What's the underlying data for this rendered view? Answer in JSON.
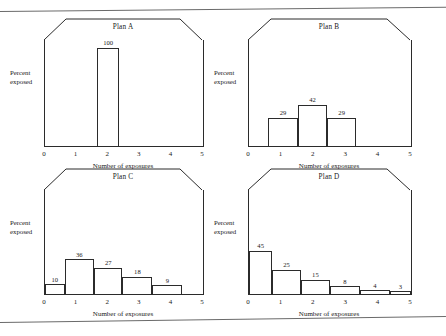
{
  "page": {
    "background": "#ffffff",
    "ink": "#2b2b2b",
    "edge_color": "#6a6a6a"
  },
  "common": {
    "ylabel": "Percent\nexposed",
    "xlabel": "Number of exposures",
    "xticks": [
      "0",
      "1",
      "2",
      "3",
      "4",
      "5"
    ]
  },
  "chart_data": [
    {
      "type": "bar",
      "title": "Plan A",
      "xlabel": "Number of exposures",
      "ylabel": "Percent exposed",
      "categories": [
        "0",
        "1",
        "2",
        "3",
        "4",
        "5"
      ],
      "tick_values": [
        0,
        1,
        2,
        3,
        4,
        5
      ],
      "bars": [
        {
          "x": 2,
          "value": 100,
          "label": "100",
          "left": 1.65,
          "right": 2.35
        }
      ],
      "xlim": [
        0,
        5
      ],
      "ylim": [
        0,
        108
      ],
      "grid": false,
      "legend": false
    },
    {
      "type": "bar",
      "title": "Plan B",
      "xlabel": "Number of exposures",
      "ylabel": "Percent exposed",
      "categories": [
        "0",
        "1",
        "2",
        "3",
        "4",
        "5"
      ],
      "tick_values": [
        0,
        1,
        2,
        3,
        4,
        5
      ],
      "bars": [
        {
          "x": 1,
          "value": 29,
          "label": "29",
          "left": 0.6,
          "right": 1.5
        },
        {
          "x": 2,
          "value": 42,
          "label": "42",
          "left": 1.5,
          "right": 2.42
        },
        {
          "x": 3,
          "value": 29,
          "label": "29",
          "left": 2.42,
          "right": 3.3
        }
      ],
      "xlim": [
        0,
        5
      ],
      "ylim": [
        0,
        108
      ],
      "grid": false,
      "legend": false
    },
    {
      "type": "bar",
      "title": "Plan C",
      "xlabel": "Number of exposures",
      "ylabel": "Percent exposed",
      "categories": [
        "0",
        "1",
        "2",
        "3",
        "4",
        "5"
      ],
      "tick_values": [
        0,
        1,
        2,
        3,
        4,
        5
      ],
      "bars": [
        {
          "x": 0,
          "value": 10,
          "label": "10",
          "left": 0.0,
          "right": 0.62
        },
        {
          "x": 1,
          "value": 36,
          "label": "36",
          "left": 0.62,
          "right": 1.55
        },
        {
          "x": 2,
          "value": 27,
          "label": "27",
          "left": 1.55,
          "right": 2.45
        },
        {
          "x": 3,
          "value": 18,
          "label": "18",
          "left": 2.45,
          "right": 3.4
        },
        {
          "x": 4,
          "value": 9,
          "label": "9",
          "left": 3.4,
          "right": 4.35
        }
      ],
      "xlim": [
        0,
        5
      ],
      "ylim": [
        0,
        108
      ],
      "grid": false,
      "legend": false
    },
    {
      "type": "bar",
      "title": "Plan D",
      "xlabel": "Number of exposures",
      "ylabel": "Percent exposed",
      "categories": [
        "0",
        "1",
        "2",
        "3",
        "4",
        "5"
      ],
      "tick_values": [
        0,
        1,
        2,
        3,
        4,
        5
      ],
      "bars": [
        {
          "x": 0,
          "value": 45,
          "label": "45",
          "left": 0.0,
          "right": 0.72
        },
        {
          "x": 1,
          "value": 25,
          "label": "25",
          "left": 0.72,
          "right": 1.6
        },
        {
          "x": 2,
          "value": 15,
          "label": "15",
          "left": 1.6,
          "right": 2.5
        },
        {
          "x": 3,
          "value": 8,
          "label": "8",
          "left": 2.5,
          "right": 3.42
        },
        {
          "x": 4,
          "value": 4,
          "label": "4",
          "left": 3.42,
          "right": 4.35
        },
        {
          "x": 5,
          "value": 3,
          "label": "3",
          "left": 4.35,
          "right": 5.0
        }
      ],
      "xlim": [
        0,
        5
      ],
      "ylim": [
        0,
        108
      ],
      "grid": false,
      "legend": false
    }
  ],
  "layout": {
    "panels": [
      {
        "left": 44,
        "top": 18,
        "width": 158,
        "height": 128,
        "ylabel_left": 10,
        "ylabel_top": 68
      },
      {
        "left": 248,
        "top": 18,
        "width": 162,
        "height": 128,
        "ylabel_left": 214,
        "ylabel_top": 68
      },
      {
        "left": 44,
        "top": 168,
        "width": 158,
        "height": 126,
        "ylabel_left": 10,
        "ylabel_top": 218
      },
      {
        "left": 248,
        "top": 168,
        "width": 162,
        "height": 126,
        "ylabel_left": 214,
        "ylabel_top": 218
      }
    ]
  }
}
